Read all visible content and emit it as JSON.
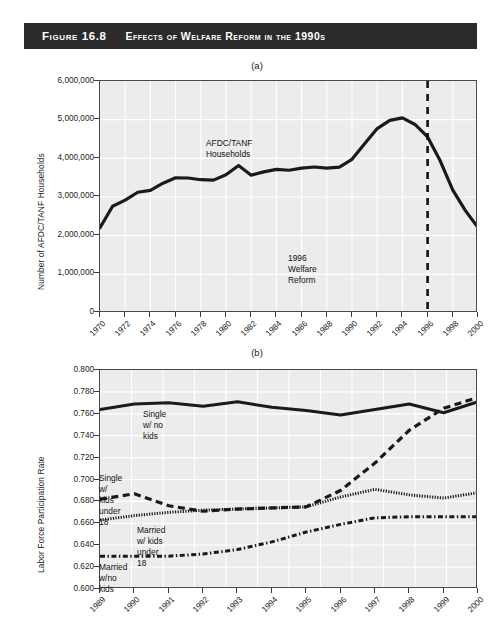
{
  "figure": {
    "number": "Figure 16.8",
    "title": "Effects of Welfare Reform in the 1990s",
    "bar_color": "#2b2b2b"
  },
  "panel_a": {
    "letter": "(a)",
    "ylabel": "Number of AFDC/TANF Households",
    "yticks": [
      "6,000,000",
      "5,000,000",
      "4,000,000",
      "3,000,000",
      "2,000,000",
      "1,000,000",
      "0"
    ],
    "xticks": [
      "1970",
      "1972",
      "1974",
      "1976",
      "1978",
      "1980",
      "1982",
      "1984",
      "1986",
      "1988",
      "1990",
      "1992",
      "1994",
      "1996",
      "1998",
      "2000"
    ],
    "series_label": "AFDC/TANF\nHouseholds",
    "event_label": "1996 Welfare Reform",
    "event_year": 1996
  },
  "panel_b": {
    "letter": "(b)",
    "ylabel": "Labor Force Participation Rate",
    "yticks": [
      "0.800",
      "0.780",
      "0.760",
      "0.740",
      "0.720",
      "0.700",
      "0.680",
      "0.660",
      "0.640",
      "0.620",
      "0.600"
    ],
    "xticks": [
      "1989",
      "1990",
      "1991",
      "1992",
      "1993",
      "1994",
      "1995",
      "1996",
      "1997",
      "1998",
      "1999",
      "2000"
    ],
    "labels": {
      "single_no_kids": "Single w/ no kids",
      "single_kids": "Single w/ kids under 18",
      "married_kids": "Married w/ kids\nunder 18",
      "married_no_kids": "Married w/no kids"
    }
  },
  "chart_data": [
    {
      "type": "line",
      "id": "panel-a",
      "title": "(a)",
      "xlabel": "",
      "ylabel": "Number of AFDC/TANF Households",
      "xlim": [
        1970,
        2000
      ],
      "ylim": [
        0,
        6000000
      ],
      "ytick_step": 1000000,
      "xtick_step": 2,
      "grid": true,
      "legend": "inline-annotation",
      "annotations": [
        {
          "text": "AFDC/TANF Households",
          "x": 1985,
          "y": 4150000
        },
        {
          "text": "1996 Welfare Reform",
          "x": 1990,
          "y": 1250000
        }
      ],
      "reference_lines": [
        {
          "x": 1996,
          "style": "dashed",
          "label": "1996 Welfare Reform"
        }
      ],
      "series": [
        {
          "name": "AFDC/TANF Households",
          "style": "solid",
          "x": [
            1970,
            1971,
            1972,
            1973,
            1974,
            1975,
            1976,
            1977,
            1978,
            1979,
            1980,
            1981,
            1982,
            1983,
            1984,
            1985,
            1986,
            1987,
            1988,
            1989,
            1990,
            1991,
            1992,
            1993,
            1994,
            1995,
            1996,
            1997,
            1998,
            1999,
            2000
          ],
          "values": [
            2208000,
            2762000,
            2918000,
            3123000,
            3170000,
            3357000,
            3498000,
            3491000,
            3447000,
            3436000,
            3574000,
            3814000,
            3565000,
            3651000,
            3714000,
            3692000,
            3748000,
            3776000,
            3748000,
            3771000,
            3974000,
            4375000,
            4769000,
            4981000,
            5046000,
            4876000,
            4553000,
            3936000,
            3176000,
            2648000,
            2208000
          ]
        }
      ]
    },
    {
      "type": "line",
      "id": "panel-b",
      "title": "(b)",
      "xlabel": "",
      "ylabel": "Labor Force Participation Rate",
      "xlim": [
        1989,
        2000
      ],
      "ylim": [
        0.6,
        0.8
      ],
      "ytick_step": 0.02,
      "xtick_step": 1,
      "grid": true,
      "legend": "inline-annotation",
      "series": [
        {
          "name": "Single w/ no kids",
          "style": "solid",
          "x": [
            1989,
            1990,
            1991,
            1992,
            1993,
            1994,
            1995,
            1996,
            1997,
            1998,
            1999,
            2000
          ],
          "values": [
            0.764,
            0.769,
            0.77,
            0.767,
            0.771,
            0.766,
            0.763,
            0.759,
            0.764,
            0.769,
            0.761,
            0.771
          ]
        },
        {
          "name": "Single w/ kids under 18",
          "style": "dashed",
          "x": [
            1989,
            1990,
            1991,
            1992,
            1993,
            1994,
            1995,
            1996,
            1997,
            1998,
            1999,
            2000
          ],
          "values": [
            0.682,
            0.687,
            0.676,
            0.671,
            0.673,
            0.674,
            0.675,
            0.69,
            0.715,
            0.745,
            0.765,
            0.775
          ]
        },
        {
          "name": "Married w/ kids under 18",
          "style": "dotted",
          "x": [
            1989,
            1990,
            1991,
            1992,
            1993,
            1994,
            1995,
            1996,
            1997,
            1998,
            1999,
            2000
          ],
          "values": [
            0.663,
            0.667,
            0.67,
            0.672,
            0.673,
            0.674,
            0.675,
            0.684,
            0.691,
            0.686,
            0.683,
            0.688
          ]
        },
        {
          "name": "Married w/no kids",
          "style": "dashdot",
          "x": [
            1989,
            1990,
            1991,
            1992,
            1993,
            1994,
            1995,
            1996,
            1997,
            1998,
            1999,
            2000
          ],
          "values": [
            0.63,
            0.63,
            0.63,
            0.632,
            0.636,
            0.643,
            0.652,
            0.659,
            0.665,
            0.666,
            0.666,
            0.666
          ]
        }
      ]
    }
  ]
}
